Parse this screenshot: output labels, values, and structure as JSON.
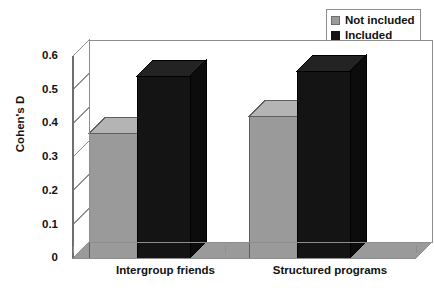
{
  "chart_data": {
    "type": "bar",
    "title": "",
    "xlabel": "",
    "ylabel": "Cohen's D",
    "categories": [
      "Intergroup friends",
      "Structured programs"
    ],
    "series": [
      {
        "name": "Not included",
        "color": "#9a9a9a",
        "values": [
          0.37,
          0.42
        ]
      },
      {
        "name": "Included",
        "color": "#141414",
        "values": [
          0.54,
          0.555
        ]
      }
    ],
    "ylim": [
      0,
      0.6
    ],
    "ytick_labels": [
      "0",
      "0.1",
      "0.2",
      "0.3",
      "0.4",
      "0.5",
      "0.6"
    ],
    "ytick_values": [
      0,
      0.1,
      0.2,
      0.3,
      0.4,
      0.5,
      0.6
    ],
    "grid": true,
    "legend_position": "top-right",
    "style": "3d-columns",
    "background": "#ffffff",
    "axis_color": "#8d8d8d"
  },
  "legend": {
    "items": [
      {
        "label": "Not included",
        "swatch": "grey"
      },
      {
        "label": "Included",
        "swatch": "black"
      }
    ]
  },
  "axis": {
    "y_title": "Cohen's D",
    "y_labels": [
      "0.6",
      "0.5",
      "0.4",
      "0.3",
      "0.2",
      "0.1",
      "0"
    ],
    "x_labels": [
      "Intergroup friends",
      "Structured programs"
    ]
  }
}
